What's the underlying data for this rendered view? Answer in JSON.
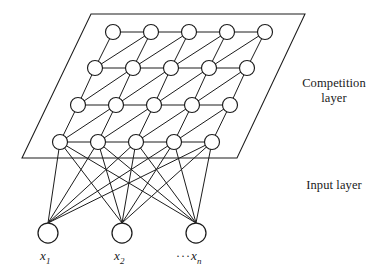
{
  "figure": {
    "type": "neural-network-architecture",
    "name": "Self-organizing map (SOM) network structure"
  },
  "labels": {
    "competition_layer": "Competition\nlayer",
    "input_layer": "Input layer"
  },
  "input_variables": [
    {
      "id": "x1",
      "base": "x",
      "subscript": "1",
      "prefix": ""
    },
    {
      "id": "x2",
      "base": "x",
      "subscript": "2",
      "prefix": ""
    },
    {
      "id": "xn",
      "base": "x",
      "subscript": "n",
      "prefix": "···"
    }
  ],
  "colors": {
    "stroke": "#1c1c1c",
    "node_fill": "#ffffff",
    "background": "#ffffff",
    "text": "#1a1a1a"
  },
  "chart_data": {
    "type": "diagram",
    "competition_layer": {
      "rows": 4,
      "cols": 5,
      "node_count": 20,
      "node_radius": 7.5,
      "row_y": [
        32,
        68,
        105,
        142
      ],
      "row_x_start": [
        113,
        95,
        78,
        60
      ],
      "col_spacing": 38,
      "plane_polygon": [
        [
          91,
          14
        ],
        [
          305,
          14
        ],
        [
          237,
          158
        ],
        [
          22,
          158
        ]
      ]
    },
    "input_layer": {
      "node_count": 3,
      "node_radius": 10,
      "node_y": 233,
      "node_x": [
        48,
        122,
        196
      ]
    },
    "connections": {
      "lattice_horizontal": true,
      "lattice_diagonal": true,
      "input_to_competition": "fully-connected-to-bottom-row",
      "fanout_line_count": 15
    }
  }
}
